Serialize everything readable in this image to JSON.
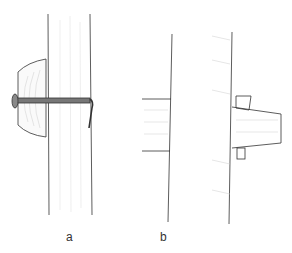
{
  "figure": {
    "panels": [
      {
        "id": "a",
        "label": "a",
        "description": "wooden peg head with nail driven through post, bent end"
      },
      {
        "id": "b",
        "label": "b",
        "description": "beam tenon through post secured with wedges"
      }
    ],
    "colors": {
      "stroke": "#333333",
      "hatch": "#bbbbbb",
      "nail": "#666666"
    }
  }
}
